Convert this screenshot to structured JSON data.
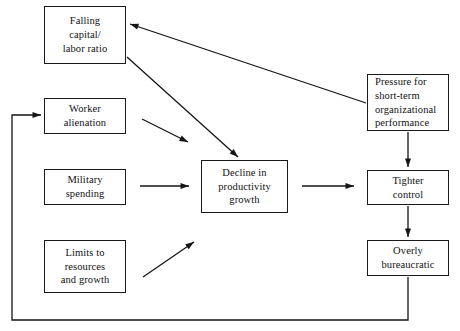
{
  "diagram": {
    "type": "flowchart",
    "stroke_color": "#151515",
    "background_color": "#ffffff",
    "nodes": [
      {
        "id": "falling-capital-labor-ratio",
        "label": "Falling\ncapital/\nlabor ratio",
        "x": 44,
        "y": 6,
        "w": 82,
        "h": 58,
        "align": "center"
      },
      {
        "id": "worker-alienation",
        "label": "Worker\nalienation",
        "x": 44,
        "y": 98,
        "w": 82,
        "h": 36,
        "align": "center"
      },
      {
        "id": "military-spending",
        "label": "Military\nspending",
        "x": 44,
        "y": 169,
        "w": 82,
        "h": 36,
        "align": "center"
      },
      {
        "id": "limits-to-resources-and-growth",
        "label": "Limits to\nresources\nand growth",
        "x": 44,
        "y": 240,
        "w": 82,
        "h": 53,
        "align": "center"
      },
      {
        "id": "decline-in-productivity-growth",
        "label": "Decline in\nproductivity\ngrowth",
        "x": 201,
        "y": 160,
        "w": 87,
        "h": 53,
        "align": "center"
      },
      {
        "id": "pressure-for-short-term-organizational-performance",
        "label": "Pressure for\nshort-term\norganizational\nperformance",
        "x": 367,
        "y": 74,
        "w": 82,
        "h": 57,
        "align": "left"
      },
      {
        "id": "tighter-control",
        "label": "Tighter\ncontrol",
        "x": 367,
        "y": 170,
        "w": 82,
        "h": 35,
        "align": "center"
      },
      {
        "id": "overly-bureaucratic",
        "label": "Overly\nbureaucratic",
        "x": 367,
        "y": 240,
        "w": 82,
        "h": 36,
        "align": "center"
      }
    ],
    "edges": [
      {
        "id": "edge-pressure-to-falling-capital",
        "from": "pressure-for-short-term-organizational-performance",
        "to": "falling-capital-labor-ratio",
        "points": "366,103 130,24",
        "arrow_at": "130,24",
        "arrow_angle": 198.5
      },
      {
        "id": "edge-falling-capital-to-decline",
        "from": "falling-capital-labor-ratio",
        "to": "decline-in-productivity-growth",
        "points": "127,57 238,157",
        "arrow_at": "238,157",
        "arrow_angle": 42
      },
      {
        "id": "edge-worker-alienation-to-decline",
        "from": "worker-alienation",
        "to": "decline-in-productivity-growth",
        "points": "142,119 188,142",
        "arrow_at": "188,142",
        "arrow_angle": 26.5
      },
      {
        "id": "edge-military-spending-to-decline",
        "from": "military-spending",
        "to": "decline-in-productivity-growth",
        "points": "140,186 189,186",
        "arrow_at": "189,186",
        "arrow_angle": 0
      },
      {
        "id": "edge-limits-to-decline",
        "from": "limits-to-resources-and-growth",
        "to": "decline-in-productivity-growth",
        "points": "143,277 194,242",
        "arrow_at": "194,242",
        "arrow_angle": -34
      },
      {
        "id": "edge-decline-to-tighter-control",
        "from": "decline-in-productivity-growth",
        "to": "tighter-control",
        "points": "302,186 354,186",
        "arrow_at": "354,186",
        "arrow_angle": 0
      },
      {
        "id": "edge-pressure-to-tighter-control",
        "from": "pressure-for-short-term-organizational-performance",
        "to": "tighter-control",
        "points": "408,132 408,167",
        "arrow_at": "408,167",
        "arrow_angle": 90
      },
      {
        "id": "edge-tighter-control-to-overly-bureaucratic",
        "from": "tighter-control",
        "to": "overly-bureaucratic",
        "points": "408,206 408,237",
        "arrow_at": "408,237",
        "arrow_angle": 90
      },
      {
        "id": "edge-overly-bureaucratic-feedback-to-worker-alienation",
        "from": "overly-bureaucratic",
        "to": "worker-alienation",
        "points": "408,277 408,320 12,320 12,115 41,115",
        "arrow_at": "41,115",
        "arrow_angle": 0
      }
    ]
  }
}
